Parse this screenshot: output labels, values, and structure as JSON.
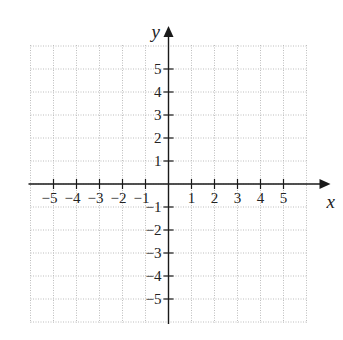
{
  "chart_data": {
    "type": "scatter",
    "title": "",
    "xlabel": "x",
    "ylabel": "y",
    "xlim": [
      -6,
      6
    ],
    "ylim": [
      -6,
      6
    ],
    "grid": true,
    "grid_style": "dotted",
    "x_ticks": [
      -5,
      -4,
      -3,
      -2,
      -1,
      1,
      2,
      3,
      4,
      5
    ],
    "x_tick_labels": [
      "−5",
      "−4",
      "−3",
      "−2",
      "−1",
      "1",
      "2",
      "3",
      "4",
      "5"
    ],
    "y_ticks": [
      5,
      4,
      3,
      2,
      1,
      -1,
      -2,
      -3,
      -4,
      -5
    ],
    "y_tick_labels": [
      "5",
      "4",
      "3",
      "2",
      "1",
      "−1",
      "−2",
      "−3",
      "−4",
      "−5"
    ],
    "series": [],
    "legend": null
  },
  "layout": {
    "origin_x": 168.5,
    "origin_y": 184,
    "unit": 23,
    "axis_color": "#1a1a1a",
    "grid_color": "#bdbdbd"
  }
}
